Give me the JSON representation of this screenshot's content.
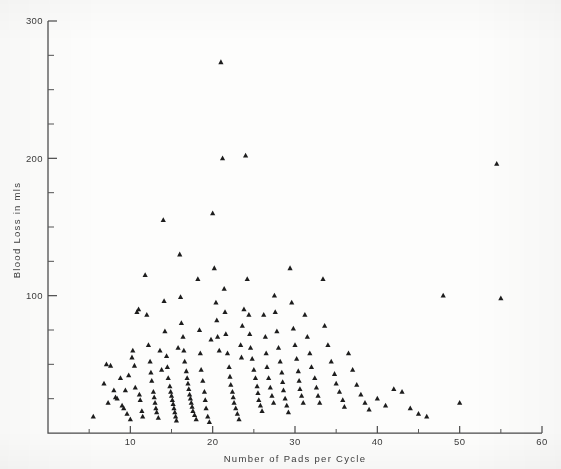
{
  "figure": {
    "title": "",
    "background_color": "#fdfdfc",
    "marker_color": "#1d1d1d",
    "axis_color": "#4a4a4a"
  },
  "axes": {
    "x_label": "Number of Pads per Cycle",
    "y_label": "Blood Loss in mls",
    "x_ticklabels": [
      "10",
      "20",
      "30",
      "40",
      "50",
      "60"
    ],
    "y_ticklabels": [
      "100",
      "200",
      "300"
    ]
  },
  "footer": {
    "faint_caption": ""
  },
  "chart_data": {
    "type": "scatter",
    "title": "",
    "xlabel": "Number of Pads per Cycle",
    "ylabel": "Blood Loss in mls",
    "xlim": [
      0,
      60
    ],
    "ylim": [
      0,
      300
    ],
    "x_ticks": [
      10,
      20,
      30,
      40,
      50,
      60
    ],
    "y_ticks": [
      100,
      200,
      300
    ],
    "x_minor_tick_step": 5,
    "y_minor_tick_step": 25,
    "grid": false,
    "legend": null,
    "marker": "triangle",
    "marker_size_px": 5,
    "series": [
      {
        "name": "Subjects",
        "points": [
          [
            5.5,
            12
          ],
          [
            6.8,
            36
          ],
          [
            7.1,
            50
          ],
          [
            7.3,
            22
          ],
          [
            7.6,
            49
          ],
          [
            8.0,
            31
          ],
          [
            8.2,
            26
          ],
          [
            8.4,
            25
          ],
          [
            8.8,
            40
          ],
          [
            9.0,
            20
          ],
          [
            9.2,
            18
          ],
          [
            9.4,
            31
          ],
          [
            9.6,
            14
          ],
          [
            9.8,
            42
          ],
          [
            10.0,
            10
          ],
          [
            10.2,
            55
          ],
          [
            10.3,
            60
          ],
          [
            10.5,
            49
          ],
          [
            10.6,
            33
          ],
          [
            10.8,
            88
          ],
          [
            11.0,
            90
          ],
          [
            11.1,
            28
          ],
          [
            11.2,
            24
          ],
          [
            11.4,
            16
          ],
          [
            11.5,
            12
          ],
          [
            11.8,
            115
          ],
          [
            12.0,
            86
          ],
          [
            12.2,
            64
          ],
          [
            12.4,
            52
          ],
          [
            12.5,
            44
          ],
          [
            12.6,
            38
          ],
          [
            12.8,
            30
          ],
          [
            12.9,
            26
          ],
          [
            13.0,
            22
          ],
          [
            13.1,
            18
          ],
          [
            13.2,
            15
          ],
          [
            13.4,
            11
          ],
          [
            13.6,
            60
          ],
          [
            13.8,
            46
          ],
          [
            14.0,
            155
          ],
          [
            14.1,
            96
          ],
          [
            14.2,
            74
          ],
          [
            14.4,
            56
          ],
          [
            14.5,
            48
          ],
          [
            14.6,
            40
          ],
          [
            14.8,
            34
          ],
          [
            14.9,
            30
          ],
          [
            15.0,
            27
          ],
          [
            15.1,
            24
          ],
          [
            15.2,
            21
          ],
          [
            15.3,
            18
          ],
          [
            15.4,
            15
          ],
          [
            15.5,
            12
          ],
          [
            15.6,
            9
          ],
          [
            15.8,
            62
          ],
          [
            16.0,
            130
          ],
          [
            16.1,
            99
          ],
          [
            16.2,
            80
          ],
          [
            16.4,
            70
          ],
          [
            16.5,
            60
          ],
          [
            16.6,
            52
          ],
          [
            16.8,
            45
          ],
          [
            16.9,
            40
          ],
          [
            17.0,
            36
          ],
          [
            17.1,
            32
          ],
          [
            17.2,
            28
          ],
          [
            17.3,
            25
          ],
          [
            17.4,
            22
          ],
          [
            17.5,
            19
          ],
          [
            17.6,
            16
          ],
          [
            17.8,
            13
          ],
          [
            18.0,
            10
          ],
          [
            18.2,
            112
          ],
          [
            18.4,
            75
          ],
          [
            18.5,
            58
          ],
          [
            18.6,
            46
          ],
          [
            18.8,
            38
          ],
          [
            19.0,
            30
          ],
          [
            19.1,
            24
          ],
          [
            19.2,
            18
          ],
          [
            19.4,
            12
          ],
          [
            19.6,
            8
          ],
          [
            19.8,
            68
          ],
          [
            20.0,
            160
          ],
          [
            20.2,
            120
          ],
          [
            20.4,
            95
          ],
          [
            20.5,
            82
          ],
          [
            20.6,
            70
          ],
          [
            20.8,
            60
          ],
          [
            21.0,
            270
          ],
          [
            21.2,
            200
          ],
          [
            21.4,
            105
          ],
          [
            21.5,
            88
          ],
          [
            21.6,
            72
          ],
          [
            21.8,
            58
          ],
          [
            22.0,
            48
          ],
          [
            22.1,
            41
          ],
          [
            22.2,
            35
          ],
          [
            22.4,
            30
          ],
          [
            22.5,
            26
          ],
          [
            22.6,
            22
          ],
          [
            22.8,
            18
          ],
          [
            23.0,
            14
          ],
          [
            23.2,
            10
          ],
          [
            23.4,
            64
          ],
          [
            23.5,
            55
          ],
          [
            23.6,
            78
          ],
          [
            23.8,
            90
          ],
          [
            24.0,
            202
          ],
          [
            24.2,
            112
          ],
          [
            24.4,
            86
          ],
          [
            24.5,
            72
          ],
          [
            24.6,
            62
          ],
          [
            24.8,
            54
          ],
          [
            25.0,
            46
          ],
          [
            25.2,
            40
          ],
          [
            25.4,
            34
          ],
          [
            25.5,
            29
          ],
          [
            25.6,
            24
          ],
          [
            25.8,
            20
          ],
          [
            26.0,
            16
          ],
          [
            26.2,
            86
          ],
          [
            26.4,
            70
          ],
          [
            26.5,
            58
          ],
          [
            26.6,
            48
          ],
          [
            26.8,
            40
          ],
          [
            27.0,
            33
          ],
          [
            27.2,
            27
          ],
          [
            27.4,
            22
          ],
          [
            27.5,
            100
          ],
          [
            27.6,
            88
          ],
          [
            27.8,
            74
          ],
          [
            28.0,
            62
          ],
          [
            28.2,
            52
          ],
          [
            28.4,
            44
          ],
          [
            28.5,
            37
          ],
          [
            28.6,
            31
          ],
          [
            28.8,
            25
          ],
          [
            29.0,
            20
          ],
          [
            29.2,
            15
          ],
          [
            29.4,
            120
          ],
          [
            29.6,
            95
          ],
          [
            29.8,
            76
          ],
          [
            30.0,
            64
          ],
          [
            30.2,
            54
          ],
          [
            30.4,
            45
          ],
          [
            30.5,
            38
          ],
          [
            30.6,
            32
          ],
          [
            30.8,
            27
          ],
          [
            31.0,
            22
          ],
          [
            31.2,
            86
          ],
          [
            31.5,
            70
          ],
          [
            31.8,
            58
          ],
          [
            32.0,
            48
          ],
          [
            32.4,
            40
          ],
          [
            32.6,
            33
          ],
          [
            32.8,
            27
          ],
          [
            33.0,
            22
          ],
          [
            33.4,
            112
          ],
          [
            33.6,
            78
          ],
          [
            34.0,
            64
          ],
          [
            34.4,
            52
          ],
          [
            34.8,
            43
          ],
          [
            35.0,
            36
          ],
          [
            35.4,
            30
          ],
          [
            35.8,
            24
          ],
          [
            36.0,
            19
          ],
          [
            36.5,
            58
          ],
          [
            37.0,
            46
          ],
          [
            37.5,
            35
          ],
          [
            38.0,
            28
          ],
          [
            38.5,
            22
          ],
          [
            39.0,
            17
          ],
          [
            40.0,
            25
          ],
          [
            41.0,
            20
          ],
          [
            42.0,
            32
          ],
          [
            43.0,
            30
          ],
          [
            44.0,
            18
          ],
          [
            45.0,
            14
          ],
          [
            46.0,
            12
          ],
          [
            48.0,
            100
          ],
          [
            50.0,
            22
          ],
          [
            54.5,
            196
          ],
          [
            55.0,
            98
          ]
        ]
      }
    ]
  }
}
